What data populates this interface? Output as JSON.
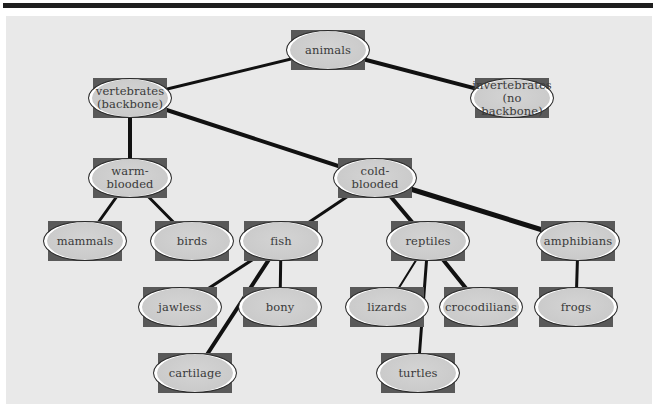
{
  "diagram": {
    "type": "concept-map / classification tree",
    "nodes": [
      {
        "id": "animals",
        "label": "animals",
        "x": 328,
        "y": 50
      },
      {
        "id": "vertebrates",
        "label": "vertebrates\n(backbone)",
        "x": 130,
        "y": 98
      },
      {
        "id": "invertebrates",
        "label": "invertebrates\n(no backbone)",
        "x": 512,
        "y": 98
      },
      {
        "id": "warm-blooded",
        "label": "warm-\nblooded",
        "x": 130,
        "y": 178
      },
      {
        "id": "cold-blooded",
        "label": "cold-\nblooded",
        "x": 375,
        "y": 178
      },
      {
        "id": "mammals",
        "label": "mammals",
        "x": 85,
        "y": 241
      },
      {
        "id": "birds",
        "label": "birds",
        "x": 192,
        "y": 241
      },
      {
        "id": "fish",
        "label": "fish",
        "x": 281,
        "y": 241
      },
      {
        "id": "reptiles",
        "label": "reptiles",
        "x": 428,
        "y": 241
      },
      {
        "id": "amphibians",
        "label": "amphibians",
        "x": 578,
        "y": 241
      },
      {
        "id": "jawless",
        "label": "jawless",
        "x": 180,
        "y": 307
      },
      {
        "id": "bony",
        "label": "bony",
        "x": 280,
        "y": 307
      },
      {
        "id": "lizards",
        "label": "lizards",
        "x": 387,
        "y": 307
      },
      {
        "id": "crocodilians",
        "label": "crocodilians",
        "x": 481,
        "y": 307
      },
      {
        "id": "frogs",
        "label": "frogs",
        "x": 576,
        "y": 307
      },
      {
        "id": "cartilage",
        "label": "cartilage",
        "x": 195,
        "y": 373
      },
      {
        "id": "turtles",
        "label": "turtles",
        "x": 418,
        "y": 373
      }
    ],
    "edges": [
      {
        "from": "animals",
        "to": "vertebrates",
        "width": 3
      },
      {
        "from": "animals",
        "to": "invertebrates",
        "width": 4
      },
      {
        "from": "vertebrates",
        "to": "warm-blooded",
        "width": 4
      },
      {
        "from": "vertebrates",
        "to": "cold-blooded",
        "width": 4
      },
      {
        "from": "warm-blooded",
        "to": "mammals",
        "width": 3
      },
      {
        "from": "warm-blooded",
        "to": "birds",
        "width": 3
      },
      {
        "from": "cold-blooded",
        "to": "fish",
        "width": 3
      },
      {
        "from": "cold-blooded",
        "to": "reptiles",
        "width": 4
      },
      {
        "from": "cold-blooded",
        "to": "amphibians",
        "width": 5
      },
      {
        "from": "fish",
        "to": "jawless",
        "width": 3
      },
      {
        "from": "fish",
        "to": "bony",
        "width": 3
      },
      {
        "from": "fish",
        "to": "cartilage",
        "width": 4
      },
      {
        "from": "reptiles",
        "to": "lizards",
        "width": 2
      },
      {
        "from": "reptiles",
        "to": "turtles",
        "width": 3
      },
      {
        "from": "reptiles",
        "to": "crocodilians",
        "width": 4
      },
      {
        "from": "amphibians",
        "to": "frogs",
        "width": 3
      }
    ]
  },
  "colors": {
    "panel_background": "#e9e9e9",
    "node_fill": "#cccccc",
    "node_shadow_rect": "#595959",
    "edge": "#111111",
    "text": "#3a3a3a",
    "top_rule": "#1e1e1e"
  }
}
